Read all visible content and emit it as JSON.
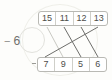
{
  "exercise": {
    "operation_sign": "−",
    "operation_value": "6",
    "operation_label": "− 6"
  },
  "top_row": {
    "name": "top-number-row",
    "cells": [
      {
        "value": "15"
      },
      {
        "value": "11"
      },
      {
        "value": "12"
      },
      {
        "value": "13"
      }
    ]
  },
  "bottom_row": {
    "name": "bottom-number-row",
    "cells": [
      {
        "value": "7"
      },
      {
        "value": "9"
      },
      {
        "value": "5"
      },
      {
        "value": "6"
      }
    ]
  },
  "connections": [
    {
      "from_index": 0,
      "from_value": "15",
      "to_index": 1,
      "to_value": "9"
    },
    {
      "from_index": 1,
      "from_value": "11",
      "to_index": 2,
      "to_value": "5"
    },
    {
      "from_index": 2,
      "from_value": "12",
      "to_index": 3,
      "to_value": "6"
    },
    {
      "from_index": 3,
      "from_value": "13",
      "to_index": 0,
      "to_value": "7"
    }
  ],
  "colors": {
    "background": "#fdfdfb",
    "box_border": "#b9b9b4",
    "cell_divider": "#cfcfc9",
    "number_text": "#4d4d4a",
    "label_text": "#6f6f6c",
    "line": "#6e6e6b",
    "line_faint": "#c9c9c3",
    "ellipse": "#e2e2dd"
  }
}
